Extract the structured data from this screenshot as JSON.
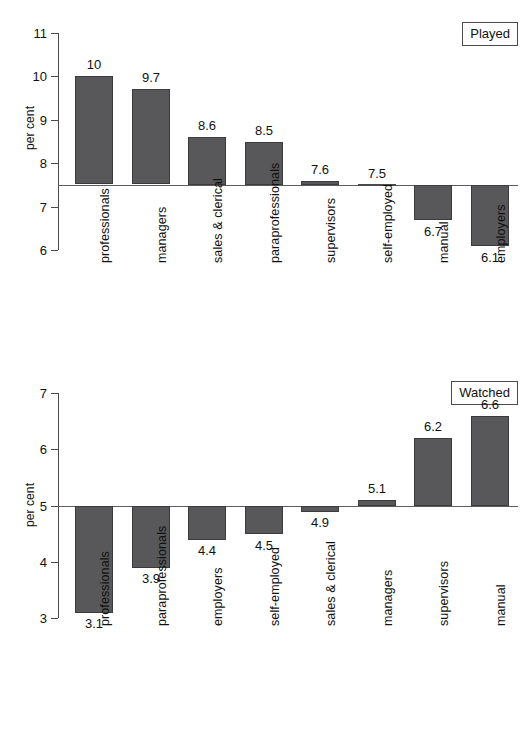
{
  "figure": {
    "ylabel_played": "per cent",
    "ylabel_watched": "per cent"
  },
  "legends": {
    "played": "Played",
    "watched": "Watched"
  },
  "chart_data": [
    {
      "type": "bar",
      "title": "Played",
      "xlabel": "",
      "ylabel": "per cent",
      "ylim": [
        6,
        11
      ],
      "yticks": [
        6,
        7,
        8,
        9,
        10,
        11
      ],
      "ytick_labels": [
        "6",
        "7",
        "8",
        "9",
        "10",
        "11"
      ],
      "baseline": 7.5,
      "grid": false,
      "legend_position": "top-right",
      "categories": [
        "professionals",
        "managers",
        "sales & clerical",
        "paraprofessionals",
        "supervisors",
        "self-employed",
        "manual",
        "employers"
      ],
      "values": [
        10,
        9.7,
        8.6,
        8.5,
        7.6,
        7.5,
        6.7,
        6.1
      ],
      "value_labels": [
        "10",
        "9.7",
        "8.6",
        "8.5",
        "7.6",
        "7.5",
        "6.7",
        "6.1"
      ]
    },
    {
      "type": "bar",
      "title": "Watched",
      "xlabel": "",
      "ylabel": "per cent",
      "ylim": [
        3,
        7
      ],
      "yticks": [
        3,
        4,
        5,
        6,
        7
      ],
      "ytick_labels": [
        "3",
        "4",
        "5",
        "6",
        "7"
      ],
      "baseline": 5,
      "grid": false,
      "legend_position": "top-right",
      "categories": [
        "professionals",
        "paraprofessionals",
        "employers",
        "self-employed",
        "sales & clerical",
        "managers",
        "supervisors",
        "manual"
      ],
      "values": [
        3.1,
        3.9,
        4.4,
        4.5,
        4.9,
        5.1,
        6.2,
        6.6
      ],
      "value_labels": [
        "3.1",
        "3.9",
        "4.4",
        "4.5",
        "4.9",
        "5.1",
        "6.2",
        "6.6"
      ]
    }
  ],
  "colors": {
    "bar_fill": "#58585a",
    "bar_stroke": "#3b3b3d",
    "axis": "#4a4a4a",
    "text": "#111111",
    "background": "#ffffff"
  }
}
